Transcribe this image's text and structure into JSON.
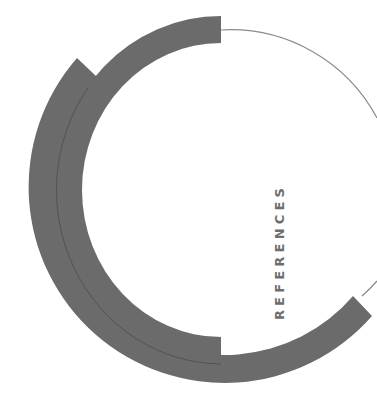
{
  "page": {
    "section_title": "REFERENCES"
  },
  "colors": {
    "band": "#6b6b6b",
    "band_seam": "#4f4f4f",
    "thin_line": "#8a8a8a",
    "title_text": "#6e6e6e",
    "background": "#ffffff"
  },
  "decor": {
    "inner_arc": {
      "center": [
        221,
        190
      ],
      "outer_radius": 174,
      "inner_radius": 147
    },
    "outer_arc": {
      "center": [
        222,
        200
      ],
      "outer_radius": 192,
      "inner_radius": 165
    },
    "thin_circle": {
      "center": [
        221,
        196
      ],
      "radius": 166
    }
  }
}
